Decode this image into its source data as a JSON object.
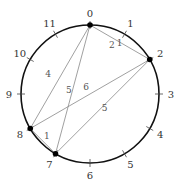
{
  "diagram": {
    "type": "pitch-class clock diagram",
    "positions": [
      "0",
      "1",
      "2",
      "3",
      "4",
      "5",
      "6",
      "7",
      "8",
      "9",
      "10",
      "11"
    ],
    "set": [
      0,
      2,
      7,
      8
    ],
    "colors": {
      "circle": "#111111",
      "chord": "#888888",
      "label": "#333333",
      "interval_label": "#555555",
      "dot": "#000000"
    },
    "chords": [
      {
        "from": 0,
        "to": 2,
        "interval_label": "2"
      },
      {
        "from": 0,
        "to": 8,
        "interval_label": "4"
      },
      {
        "from": 0,
        "to": 7,
        "interval_label": "5"
      },
      {
        "from": 2,
        "to": 8,
        "interval_label": "6"
      },
      {
        "from": 2,
        "to": 7,
        "interval_label": "5"
      },
      {
        "from": 8,
        "to": 7,
        "interval_label": "1"
      }
    ],
    "arcs": [
      {
        "from": 0,
        "to": 2,
        "label": "1",
        "note": "short arc label near 0-2"
      }
    ]
  }
}
